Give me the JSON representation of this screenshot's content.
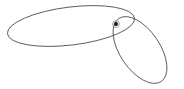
{
  "canvas": {
    "width": 184,
    "height": 89,
    "background_color": "#ffffff",
    "title": ""
  },
  "chart_data": {
    "type": "diagram",
    "title": "",
    "subtitle": "",
    "xlabel": "",
    "ylabel": "",
    "grid": false,
    "legend": false,
    "axes_visible": false,
    "tick_labels": [],
    "annotations": [],
    "stroke_color": "#4a4a4a",
    "stroke_width": 0.9,
    "shapes": [
      {
        "name": "large-ellipse",
        "type": "ellipse",
        "cx": 71,
        "cy": 26,
        "rx": 64,
        "ry": 19,
        "rotation_deg": -7,
        "fill": "none",
        "stroke": "#4a4a4a"
      },
      {
        "name": "small-ellipse",
        "type": "ellipse",
        "cx": 140,
        "cy": 50,
        "rx": 38,
        "ry": 20,
        "rotation_deg": 56,
        "fill": "none",
        "stroke": "#4a4a4a"
      }
    ],
    "points": [
      {
        "name": "marker-dot",
        "x": 116,
        "y": 24,
        "radius": 2,
        "ring_radius": 3.4,
        "fill": "#1a1a1a",
        "ring_stroke": "#8d8d8d",
        "label": ""
      }
    ],
    "xlim": [
      0,
      184
    ],
    "ylim": [
      0,
      89
    ]
  },
  "accessibility": {
    "figure_label": "Diagram of two intersecting ellipses with a marked point"
  }
}
